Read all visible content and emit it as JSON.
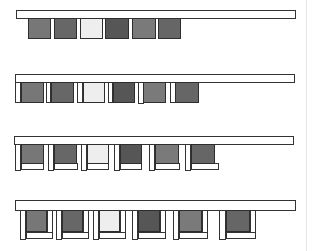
{
  "diagram": {
    "type": "sequence",
    "block_colors": [
      "#777777",
      "#676767",
      "#eeeeee",
      "#565656",
      "#7a7a7a",
      "#666666"
    ],
    "beam_color": "#ffffff",
    "outline_color": "#333333",
    "stages": [
      {
        "id": 1,
        "beam": {
          "x": 16,
          "y": 10,
          "w": 280,
          "h": 9
        },
        "units": [
          {
            "block": [
              28,
              18,
              23,
              21
            ]
          },
          {
            "block": [
              54,
              18,
              23,
              21
            ]
          },
          {
            "block": [
              80,
              18,
              23,
              21
            ]
          },
          {
            "block": [
              105,
              18,
              24,
              21
            ]
          },
          {
            "block": [
              132,
              18,
              24,
              21
            ]
          },
          {
            "block": [
              158,
              18,
              23,
              21
            ]
          }
        ]
      },
      {
        "id": 2,
        "beam": {
          "x": 15,
          "y": 74,
          "w": 280,
          "h": 9
        },
        "units": [
          {
            "post": [
              15,
              82,
              6,
              21
            ],
            "block": [
              21,
              82,
              23,
              21
            ]
          },
          {
            "post": [
              46,
              82,
              5,
              21
            ],
            "block": [
              51,
              82,
              23,
              21
            ]
          },
          {
            "post": [
              77,
              82,
              6,
              21
            ],
            "block": [
              83,
              82,
              22,
              21
            ]
          },
          {
            "post": [
              108,
              82,
              5,
              21
            ],
            "block": [
              113,
              82,
              22,
              21
            ]
          },
          {
            "post": [
              138,
              82,
              6,
              22
            ],
            "block": [
              143,
              82,
              23,
              21
            ]
          },
          {
            "post": [
              170,
              82,
              6,
              21
            ],
            "block": [
              175,
              82,
              24,
              21
            ]
          }
        ]
      },
      {
        "id": 3,
        "beam": {
          "x": 14,
          "y": 136,
          "w": 280,
          "h": 9
        },
        "units": [
          {
            "post": [
              15,
              144,
              6,
              27
            ],
            "block": [
              21,
              144,
              23,
              20
            ],
            "foot": [
              21,
              163,
              23,
              7
            ]
          },
          {
            "post": [
              48,
              144,
              6,
              27
            ],
            "block": [
              54,
              144,
              23,
              20
            ],
            "foot": [
              54,
              163,
              24,
              7
            ]
          },
          {
            "post": [
              81,
              144,
              6,
              27
            ],
            "block": [
              87,
              144,
              22,
              20
            ],
            "foot": [
              87,
              163,
              22,
              7
            ]
          },
          {
            "post": [
              114,
              144,
              6,
              27
            ],
            "block": [
              120,
              144,
              22,
              20
            ],
            "foot": [
              120,
              163,
              22,
              7
            ]
          },
          {
            "post": [
              149,
              144,
              6,
              27
            ],
            "block": [
              155,
              144,
              24,
              20
            ],
            "foot": [
              155,
              163,
              25,
              7
            ]
          },
          {
            "post": [
              185,
              144,
              6,
              27
            ],
            "block": [
              191,
              144,
              24,
              20
            ],
            "foot": [
              191,
              163,
              28,
              7
            ]
          }
        ]
      },
      {
        "id": 4,
        "beam": {
          "x": 15,
          "y": 200,
          "w": 281,
          "h": 11
        },
        "units": [
          {
            "post": [
              20,
              210,
              6,
              30
            ],
            "block": [
              26,
              210,
              21,
              22
            ],
            "post2": [
              47,
              210,
              6,
              23
            ],
            "foot": [
              26,
              232,
              27,
              7
            ]
          },
          {
            "post": [
              56,
              210,
              6,
              30
            ],
            "block": [
              62,
              210,
              21,
              22
            ],
            "post2": [
              83,
              210,
              6,
              23
            ],
            "foot": [
              62,
              232,
              27,
              7
            ]
          },
          {
            "post": [
              93,
              210,
              6,
              30
            ],
            "block": [
              99,
              210,
              21,
              22
            ],
            "post2": [
              120,
              210,
              6,
              23
            ],
            "foot": [
              99,
              232,
              27,
              7
            ]
          },
          {
            "post": [
              132,
              210,
              6,
              30
            ],
            "block": [
              138,
              210,
              22,
              22
            ],
            "post2": [
              160,
              210,
              6,
              23
            ],
            "foot": [
              138,
              232,
              28,
              7
            ]
          },
          {
            "post": [
              173,
              210,
              6,
              30
            ],
            "block": [
              179,
              210,
              23,
              22
            ],
            "post2": [
              202,
              210,
              6,
              23
            ],
            "foot": [
              179,
              232,
              29,
              7
            ]
          },
          {
            "post": [
              219,
              210,
              7,
              30
            ],
            "block": [
              226,
              210,
              24,
              22
            ],
            "post2": [
              250,
              210,
              6,
              23
            ],
            "foot": [
              226,
              232,
              30,
              7
            ]
          }
        ]
      }
    ]
  }
}
